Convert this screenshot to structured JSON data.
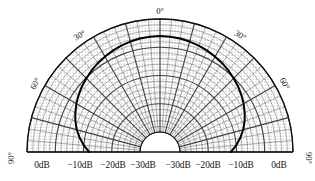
{
  "chart_data": {
    "type": "line",
    "subtype": "polar-directivity-half",
    "title": "",
    "xlabel": "",
    "ylabel": "",
    "grid": true,
    "legend": null,
    "shading": "stippled-dots",
    "background_color": "#ffffff",
    "grid_color": "#3a3a3a",
    "curve_color": "#000000",
    "fill_color": "#ffffff",
    "angle_unit": "degrees",
    "angle_range": [
      -90,
      90
    ],
    "angle_tick_labels": [
      {
        "id": "left-90",
        "text": "90°",
        "angle": -90,
        "rotate": -90,
        "x": 12,
        "y": 158
      },
      {
        "id": "left-60",
        "text": "60°",
        "angle": -60,
        "rotate": -60,
        "x": 36,
        "y": 84
      },
      {
        "id": "left-30",
        "text": "30°",
        "angle": -30,
        "rotate": -30,
        "x": 80,
        "y": 36
      },
      {
        "id": "top-0",
        "text": "0°",
        "angle": 0,
        "rotate": 0,
        "x": 160,
        "y": 12
      },
      {
        "id": "right-30",
        "text": "30°",
        "angle": 30,
        "rotate": 30,
        "x": 240,
        "y": 36
      },
      {
        "id": "right-60",
        "text": "60°",
        "angle": 60,
        "rotate": 60,
        "x": 284,
        "y": 84
      },
      {
        "id": "right-90",
        "text": "90°",
        "angle": 90,
        "rotate": 90,
        "x": 308,
        "y": 158
      }
    ],
    "radial_unit": "dB",
    "radial_range": [
      -40,
      0
    ],
    "radial_major_ticks": [
      0,
      -10,
      -20,
      -30
    ],
    "radial_minor_step": 2,
    "radial_tick_labels_left": [
      {
        "text": "0dB",
        "value": 0,
        "x": 42
      },
      {
        "text": "−10dB",
        "value": -10,
        "x": 80
      },
      {
        "text": "−20dB",
        "value": -20,
        "x": 113
      },
      {
        "text": "−30dB",
        "value": -30,
        "x": 143
      }
    ],
    "radial_tick_labels_right": [
      {
        "text": "−30dB",
        "value": -30,
        "x": 178
      },
      {
        "text": "−20dB",
        "value": -20,
        "x": 208
      },
      {
        "text": "−10dB",
        "value": -10,
        "x": 241
      },
      {
        "text": "0dB",
        "value": 0,
        "x": 279
      }
    ],
    "center_x": 160,
    "center_y": 152,
    "outer_radius": 133,
    "inner_radius": 20,
    "angular_sector_step": 5,
    "angular_major_step": 15,
    "series": [
      {
        "name": "Directivity pattern",
        "note": "Level in dB vs. angle in degrees (0° = on-axis, ±90° = edge)",
        "angles": [
          -90,
          -85,
          -80,
          -75,
          -70,
          -65,
          -60,
          -55,
          -50,
          -45,
          -40,
          -35,
          -30,
          -25,
          -20,
          -15,
          -10,
          -5,
          0,
          5,
          10,
          15,
          20,
          25,
          30,
          35,
          40,
          45,
          50,
          55,
          60,
          65,
          70,
          75,
          80,
          85,
          90
        ],
        "values": [
          -22.0,
          -20.0,
          -18.2,
          -16.6,
          -15.2,
          -14.0,
          -12.9,
          -11.9,
          -11.0,
          -10.2,
          -9.4,
          -8.7,
          -8.1,
          -7.5,
          -7.0,
          -6.6,
          -6.3,
          -6.1,
          -6.0,
          -6.1,
          -6.3,
          -6.6,
          -7.0,
          -7.5,
          -8.1,
          -8.7,
          -9.4,
          -10.2,
          -11.0,
          -11.9,
          -12.9,
          -14.0,
          -15.2,
          -16.6,
          -18.2,
          -20.0,
          -22.0
        ]
      }
    ]
  },
  "figure": {
    "caption": ""
  }
}
